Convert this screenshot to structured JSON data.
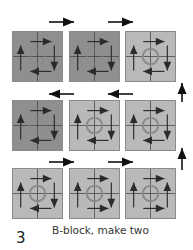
{
  "caption": "B-block, make two",
  "step_number": "3",
  "colors": {
    "dark_fabric": "#8f8f8f",
    "light_fabric": "#b9b9b9",
    "arrow": "#2b2b2b",
    "circle": "#8c8c8c"
  },
  "rows": [
    {
      "blocks": [
        {
          "shade": "dark",
          "top": "right",
          "left": "up",
          "right": "down",
          "bottom": "left"
        },
        {
          "shade": "dark",
          "top": "right",
          "left": "up",
          "right": "down",
          "bottom": "left"
        },
        {
          "shade": "light",
          "top": "right",
          "left": "up",
          "right": "down",
          "bottom": "left"
        }
      ],
      "row_arrow": "right"
    },
    {
      "blocks": [
        {
          "shade": "dark",
          "top": "right",
          "left": "up",
          "right": "down",
          "bottom": "left"
        },
        {
          "shade": "light",
          "top": "right",
          "left": "up",
          "right": "down",
          "bottom": "left"
        },
        {
          "shade": "light",
          "top": "right",
          "left": "up",
          "right": "down",
          "bottom": "left"
        }
      ],
      "row_arrow": "left"
    },
    {
      "blocks": [
        {
          "shade": "light",
          "top": "right",
          "left": "up",
          "right": "down",
          "bottom": "left"
        },
        {
          "shade": "light",
          "top": "right",
          "left": "up",
          "right": "down",
          "bottom": "right"
        },
        {
          "shade": "light",
          "top": "right",
          "left": "up",
          "right": "up",
          "bottom": "right"
        }
      ],
      "row_arrow": "right"
    }
  ]
}
